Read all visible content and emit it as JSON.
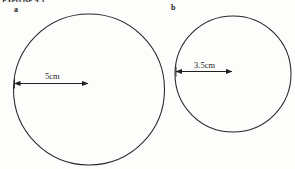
{
  "worksheet": {
    "title": "Exercise 9.1"
  },
  "figures": [
    {
      "label": "a",
      "shape": "circle",
      "dimension_kind": "radius",
      "dimension_text": "5cm",
      "value": 5,
      "unit": "cm"
    },
    {
      "label": "b",
      "shape": "circle",
      "dimension_kind": "radius",
      "dimension_text": "3.5cm",
      "value": 3.5,
      "unit": "cm"
    }
  ],
  "colors": {
    "background": "#fdfdfb",
    "stroke": "#1f1f1f",
    "text": "#1a1a1a"
  }
}
